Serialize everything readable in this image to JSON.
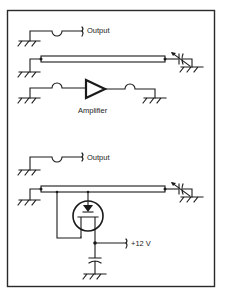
{
  "figure": {
    "type": "circuit-diagram",
    "panels": [
      {
        "id": "top",
        "labels": {
          "output": "Output",
          "amplifier": "Amplifier"
        },
        "components": [
          "output-line-with-loop",
          "coaxial-line",
          "variable-capacitor",
          "amplifier-with-loops",
          "ground-symbols"
        ]
      },
      {
        "id": "bottom",
        "labels": {
          "output": "Output",
          "supply": "+12 V"
        },
        "components": [
          "output-line-with-loop",
          "coaxial-line",
          "variable-capacitor",
          "fet-transistor",
          "bypass-capacitor",
          "ground-symbols"
        ]
      }
    ]
  },
  "colors": {
    "ink": "#1a1a1a",
    "background": "#ffffff"
  }
}
